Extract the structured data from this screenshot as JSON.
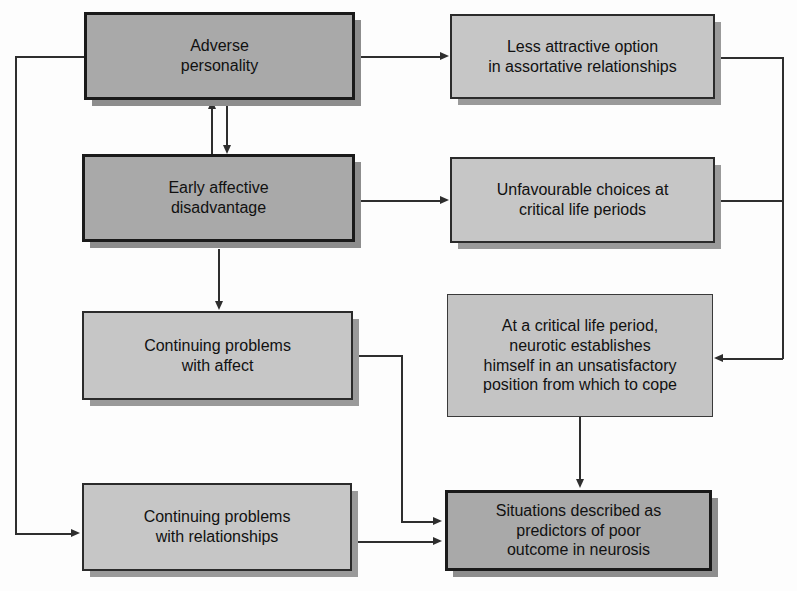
{
  "diagram": {
    "nodes": [
      {
        "id": "adverse-personality",
        "text": "Adverse\npersonality",
        "style": "dark",
        "font_size": 16
      },
      {
        "id": "early-affective-disadvantage",
        "text": "Early affective\ndisadvantage",
        "style": "dark",
        "font_size": 16
      },
      {
        "id": "continuing-problems-affect",
        "text": "Continuing problems\nwith affect",
        "style": "light",
        "font_size": 16
      },
      {
        "id": "continuing-problems-relationships",
        "text": "Continuing problems\nwith relationships",
        "style": "light",
        "font_size": 16
      },
      {
        "id": "less-attractive-option",
        "text": "Less attractive option\nin assortative relationships",
        "style": "light",
        "font_size": 16
      },
      {
        "id": "unfavourable-choices",
        "text": "Unfavourable choices at\ncritical life periods",
        "style": "light",
        "font_size": 16
      },
      {
        "id": "critical-life-period",
        "text": "At a critical life period,\nneurotic establishes\nhimself in an unsatisfactory\nposition from which to cope",
        "style": "plain",
        "font_size": 16
      },
      {
        "id": "situations-described",
        "text": "Situations described as\npredictors of poor\noutcome in neurosis",
        "style": "dark",
        "font_size": 16
      }
    ],
    "edges": [
      {
        "id": "edge-adverse-to-early",
        "from": "adverse-personality",
        "to": "early-affective-disadvantage",
        "direction": "down"
      },
      {
        "id": "edge-early-to-adverse",
        "from": "early-affective-disadvantage",
        "to": "adverse-personality",
        "direction": "up"
      },
      {
        "id": "edge-early-to-affect",
        "from": "early-affective-disadvantage",
        "to": "continuing-problems-affect",
        "direction": "down"
      },
      {
        "id": "edge-adverse-to-relationships",
        "from": "adverse-personality",
        "to": "continuing-problems-relationships",
        "direction": "loop-left"
      },
      {
        "id": "edge-adverse-to-less-attractive",
        "from": "adverse-personality",
        "to": "less-attractive-option",
        "direction": "right"
      },
      {
        "id": "edge-early-to-unfavourable",
        "from": "early-affective-disadvantage",
        "to": "unfavourable-choices",
        "direction": "right"
      },
      {
        "id": "edge-less-attractive-to-critical",
        "from": "less-attractive-option",
        "to": "critical-life-period",
        "direction": "loop-right"
      },
      {
        "id": "edge-unfavourable-to-critical",
        "from": "unfavourable-choices",
        "to": "critical-life-period",
        "direction": "loop-right"
      },
      {
        "id": "edge-critical-to-situations",
        "from": "critical-life-period",
        "to": "situations-described",
        "direction": "down"
      },
      {
        "id": "edge-affect-to-situations",
        "from": "continuing-problems-affect",
        "to": "situations-described",
        "direction": "right-down"
      },
      {
        "id": "edge-relationships-to-situations",
        "from": "continuing-problems-relationships",
        "to": "situations-described",
        "direction": "right"
      }
    ],
    "colors": {
      "dark_fill": "#a9a9a9",
      "light_fill": "#c6c6c6",
      "plain_fill": "#c4c4c4",
      "line": "#2e2e2e",
      "border": "#1a1a1a",
      "background": "#fdfdfd"
    }
  }
}
